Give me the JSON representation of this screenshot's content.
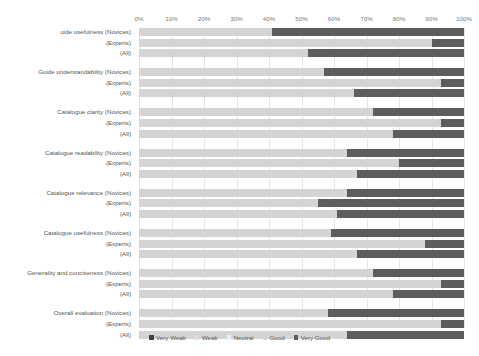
{
  "chart_data": {
    "type": "bar",
    "orientation": "horizontal",
    "stacked": true,
    "stack_mode": "percent",
    "title": "",
    "xlabel": "",
    "ylabel": "",
    "xlim": [
      0,
      100
    ],
    "grid": true,
    "legend_position": "bottom",
    "xticks": [
      "0%",
      "10%",
      "20%",
      "30%",
      "40%",
      "50%",
      "60%",
      "70%",
      "80%",
      "90%",
      "100%"
    ],
    "xtick_values": [
      0,
      10,
      20,
      30,
      40,
      50,
      60,
      70,
      80,
      90,
      100
    ],
    "legend": [
      "Very Weak",
      "Weak",
      "Neutral",
      "Good",
      "Very Good"
    ],
    "series_colors": [
      "#3f3f3f",
      "#dedede",
      "#efefef",
      "#d4d4d4",
      "#5d5d5d"
    ],
    "groups": [
      {
        "name": "Guide usefulness",
        "rows": [
          {
            "label": "uide usefulness (Novices)",
            "values": [
              0,
              0,
              0,
              41,
              59
            ]
          },
          {
            "label": "(Experts)",
            "values": [
              0,
              0,
              0,
              90,
              10
            ]
          },
          {
            "label": "(All)",
            "values": [
              0,
              0,
              0,
              52,
              48
            ]
          }
        ]
      },
      {
        "name": "Guide understandability",
        "rows": [
          {
            "label": "Guide understandability (Novices)",
            "values": [
              0,
              0,
              0,
              57,
              43
            ]
          },
          {
            "label": "(Experts)",
            "values": [
              0,
              0,
              0,
              93,
              7
            ]
          },
          {
            "label": "(All)",
            "values": [
              0,
              0,
              0,
              66,
              34
            ]
          }
        ]
      },
      {
        "name": "Catalogue clarity",
        "rows": [
          {
            "label": "Catalogue clarity (Novices)",
            "values": [
              0,
              0,
              0,
              72,
              28
            ]
          },
          {
            "label": "(Experts)",
            "values": [
              0,
              0,
              0,
              93,
              7
            ]
          },
          {
            "label": "(All)",
            "values": [
              0,
              0,
              0,
              78,
              22
            ]
          }
        ]
      },
      {
        "name": "Catalogue readability",
        "rows": [
          {
            "label": "Catalogue readability (Novices)",
            "values": [
              0,
              0,
              0,
              64,
              36
            ]
          },
          {
            "label": "(Experts)",
            "values": [
              0,
              0,
              0,
              80,
              20
            ]
          },
          {
            "label": "(All)",
            "values": [
              0,
              0,
              0,
              67,
              33
            ]
          }
        ]
      },
      {
        "name": "Catalogue relevance",
        "rows": [
          {
            "label": "Catalogue relevance (Novices)",
            "values": [
              0,
              0,
              0,
              64,
              36
            ]
          },
          {
            "label": "(Experts)",
            "values": [
              0,
              0,
              0,
              55,
              45
            ]
          },
          {
            "label": "(All)",
            "values": [
              0,
              0,
              0,
              61,
              39
            ]
          }
        ]
      },
      {
        "name": "Catalogue usefulness",
        "rows": [
          {
            "label": "Catalogue usefulness (Novices)",
            "values": [
              0,
              0,
              0,
              59,
              41
            ]
          },
          {
            "label": "(Experts)",
            "values": [
              0,
              0,
              0,
              88,
              12
            ]
          },
          {
            "label": "(All)",
            "values": [
              0,
              0,
              0,
              67,
              33
            ]
          }
        ]
      },
      {
        "name": "Generality and conciseness",
        "rows": [
          {
            "label": "Generality and conciseness (Novices)",
            "values": [
              0,
              0,
              0,
              72,
              28
            ]
          },
          {
            "label": "(Experts)",
            "values": [
              0,
              0,
              0,
              93,
              7
            ]
          },
          {
            "label": "(All)",
            "values": [
              0,
              0,
              0,
              78,
              22
            ]
          }
        ]
      },
      {
        "name": "Overall evaluation",
        "rows": [
          {
            "label": "Overall evaluation (Novices)",
            "values": [
              0,
              0,
              0,
              58,
              42
            ]
          },
          {
            "label": "(Experts)",
            "values": [
              0,
              0,
              0,
              93,
              7
            ]
          },
          {
            "label": "(All)",
            "values": [
              0,
              0,
              0,
              64,
              36
            ]
          }
        ]
      }
    ]
  }
}
